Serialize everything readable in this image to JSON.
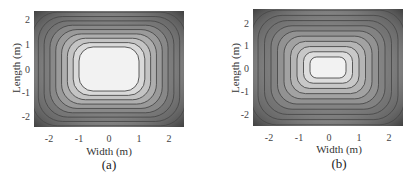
{
  "chart_data": [
    {
      "type": "heatmap",
      "subtype": "filled contour",
      "panel_label": "(a)",
      "title": "",
      "xlabel": "Width (m)",
      "ylabel": "Length (m)",
      "xlim": [
        -2.5,
        2.5
      ],
      "ylim": [
        -2.5,
        2.5
      ],
      "xticks": [
        -2,
        -1,
        0,
        1,
        2
      ],
      "yticks": [
        2,
        1,
        0,
        -1,
        -2
      ],
      "grid": false,
      "legend": null,
      "colormap": "grayscale, light center to dark corners",
      "contours": {
        "count": 9,
        "shape": "rounded rectangle",
        "innermost_half_extent_m": [
          1.0,
          0.95
        ],
        "note": "large uniform light plateau at center spanning approx x:-1..1, y:-0.9..1.0"
      }
    },
    {
      "type": "heatmap",
      "subtype": "filled contour",
      "panel_label": "(b)",
      "title": "",
      "xlabel": "Width (m)",
      "ylabel": "Length (m)",
      "xlim": [
        -2.5,
        2.5
      ],
      "ylim": [
        -2.5,
        2.5
      ],
      "xticks": [
        -2,
        -1,
        0,
        1,
        2
      ],
      "yticks": [
        2,
        1,
        0,
        -1,
        -2
      ],
      "grid": false,
      "legend": null,
      "colormap": "grayscale, light center to dark corners",
      "contours": {
        "count": 10,
        "shape": "rounded rectangle",
        "innermost_half_extent_m": [
          0.6,
          0.45
        ],
        "note": "small bright core at center approx x:-0.6..0.6, y:-0.45..0.5, surrounded by light band to approx +/-1.1"
      }
    }
  ],
  "panels": [
    {
      "caption": "(a)",
      "xlabel": "Width (m)",
      "ylabel": "Length (m)",
      "xticks": [
        "-2",
        "-1",
        "0",
        "1",
        "2"
      ],
      "yticks": [
        "2",
        "1",
        "0",
        "-1",
        "-2"
      ]
    },
    {
      "caption": "(b)",
      "xlabel": "Width (m)",
      "ylabel": "Length (m)",
      "xticks": [
        "-2",
        "-1",
        "0",
        "1",
        "2"
      ],
      "yticks": [
        "2",
        "1",
        "0",
        "-1",
        "-2"
      ]
    }
  ],
  "colors": {
    "center": "#f4f4f4",
    "edge": "#5a5a5a",
    "corner": "#3c3c3c",
    "contour_line": "#4a4a4a"
  }
}
